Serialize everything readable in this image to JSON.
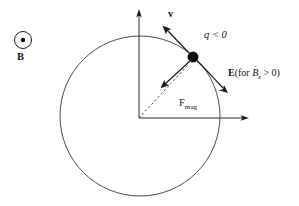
{
  "figure": {
    "kind": "physics-diagram",
    "title_visible": false,
    "background_color": "#ffffff",
    "width": 299,
    "height": 206
  },
  "colors": {
    "ink": "#1a1a1a",
    "orbit": "#4a4a4a",
    "axis": "#2b2b2b",
    "dashed": "#3d3d3d",
    "particle": "#0c0c0c",
    "background": "#ffffff"
  },
  "bfield_marker": {
    "icon": "circle-with-center-dot-icon",
    "meaning": "field out of page",
    "label": "B",
    "center_x": 23,
    "center_y": 40,
    "radius": 8.5,
    "dot_radius": 2.2
  },
  "axes": {
    "origin_x": 139,
    "origin_y": 118,
    "x_axis_end_x": 248,
    "x_axis_end_y": 118,
    "y_axis_end_x": 139,
    "y_axis_end_y": 12,
    "x_tick_label": "",
    "y_tick_label": ""
  },
  "orbit": {
    "center_x": 140,
    "center_y": 116,
    "radius": 80,
    "style": "solid"
  },
  "particle": {
    "label": "q < 0",
    "charge_sign": "negative",
    "x": 193,
    "y": 57,
    "radius": 5.2
  },
  "vectors": [
    {
      "name": "velocity",
      "label": "v",
      "bold": true,
      "from_x": 193,
      "from_y": 57,
      "to_x": 163,
      "to_y": 26,
      "label_x": 168,
      "label_y": 9
    },
    {
      "name": "magnetic-force",
      "label": "F",
      "label_subscript": "mag",
      "bold": false,
      "from_x": 190,
      "from_y": 62,
      "to_x": 161,
      "to_y": 88,
      "label_x": 179,
      "label_y": 98
    },
    {
      "name": "electric-field",
      "label": "E",
      "bold": true,
      "from_x": 197,
      "from_y": 62,
      "to_x": 228,
      "to_y": 93,
      "label_x": 228,
      "label_y": 68
    }
  ],
  "dashed_radius": {
    "from_x": 139,
    "from_y": 118,
    "to_x": 190,
    "to_y": 63
  },
  "labels": {
    "b_field": "B",
    "velocity": "v",
    "charge": "q < 0",
    "efield_prefix": "E",
    "efield_condition_open": "(for ",
    "efield_b_symbol": "B",
    "efield_b_subscript": "z",
    "efield_condition_close": " > 0)",
    "efield_full": "E (for Ḃz > 0)",
    "force_base": "F",
    "force_subscript": "mag",
    "force_full": "Fmag"
  }
}
